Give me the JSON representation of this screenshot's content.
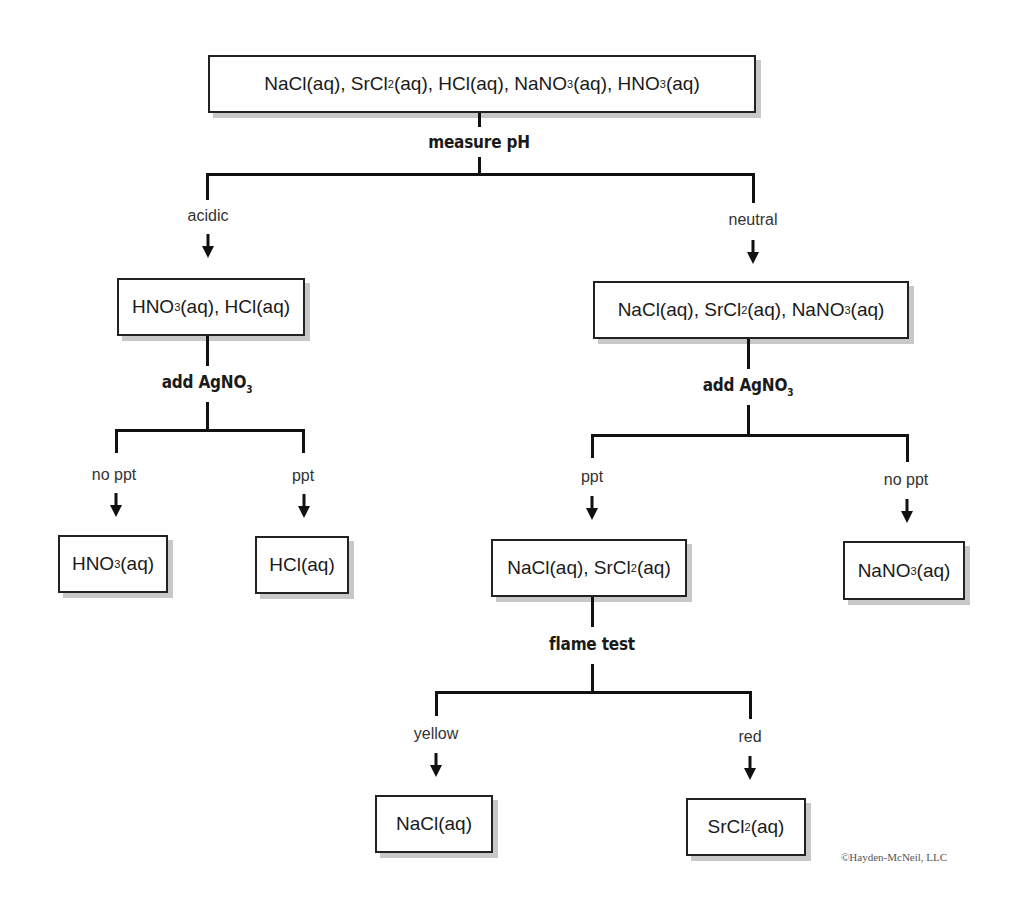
{
  "diagram": {
    "type": "flowchart",
    "root": {
      "parts": [
        [
          "NaCl(aq), SrCl",
          ""
        ],
        [
          "2",
          "sub"
        ],
        [
          "(aq), HCl(aq), NaNO",
          ""
        ],
        [
          "3",
          "sub"
        ],
        [
          "(aq), HNO",
          ""
        ],
        [
          "3",
          "sub"
        ],
        [
          "(aq)",
          ""
        ]
      ]
    },
    "step1": {
      "op": "measure pH"
    },
    "branch_acidic": {
      "label": "acidic"
    },
    "branch_neutral": {
      "label": "neutral"
    },
    "acidic_box": {
      "parts": [
        [
          "HNO",
          ""
        ],
        [
          "3",
          "sub"
        ],
        [
          "(aq), HCl(aq)",
          ""
        ]
      ]
    },
    "neutral_box": {
      "parts": [
        [
          "NaCl(aq), SrCl",
          ""
        ],
        [
          "2",
          "sub"
        ],
        [
          "(aq), NaNO",
          ""
        ],
        [
          "3",
          "sub"
        ],
        [
          "(aq)",
          ""
        ]
      ]
    },
    "acidic_op": {
      "parts": [
        [
          "add AgNO",
          ""
        ],
        [
          "3",
          "sub"
        ]
      ]
    },
    "neutral_op": {
      "parts": [
        [
          "add AgNO",
          ""
        ],
        [
          "3",
          "sub"
        ]
      ]
    },
    "acidic_left_label": "no ppt",
    "acidic_right_label": "ppt",
    "neutral_left_label": "ppt",
    "neutral_right_label": "no ppt",
    "hno3_box": {
      "parts": [
        [
          "HNO",
          ""
        ],
        [
          "3",
          "sub"
        ],
        [
          "(aq)",
          ""
        ]
      ]
    },
    "hcl_box": {
      "parts": [
        [
          "HCl(aq)",
          ""
        ]
      ]
    },
    "nacl_srcl2_box": {
      "parts": [
        [
          "NaCl(aq), SrCl",
          ""
        ],
        [
          "2",
          "sub"
        ],
        [
          "(aq)",
          ""
        ]
      ]
    },
    "nano3_box": {
      "parts": [
        [
          "NaNO",
          ""
        ],
        [
          "3",
          "sub"
        ],
        [
          "(aq)",
          ""
        ]
      ]
    },
    "flame_op": "flame test",
    "flame_left_label": "yellow",
    "flame_right_label": "red",
    "nacl_box": {
      "parts": [
        [
          "NaCl(aq)",
          ""
        ]
      ]
    },
    "srcl2_box": {
      "parts": [
        [
          "SrCl",
          ""
        ],
        [
          "2",
          "sub"
        ],
        [
          "(aq)",
          ""
        ]
      ]
    },
    "copyright": "©Hayden-McNeil, LLC"
  }
}
